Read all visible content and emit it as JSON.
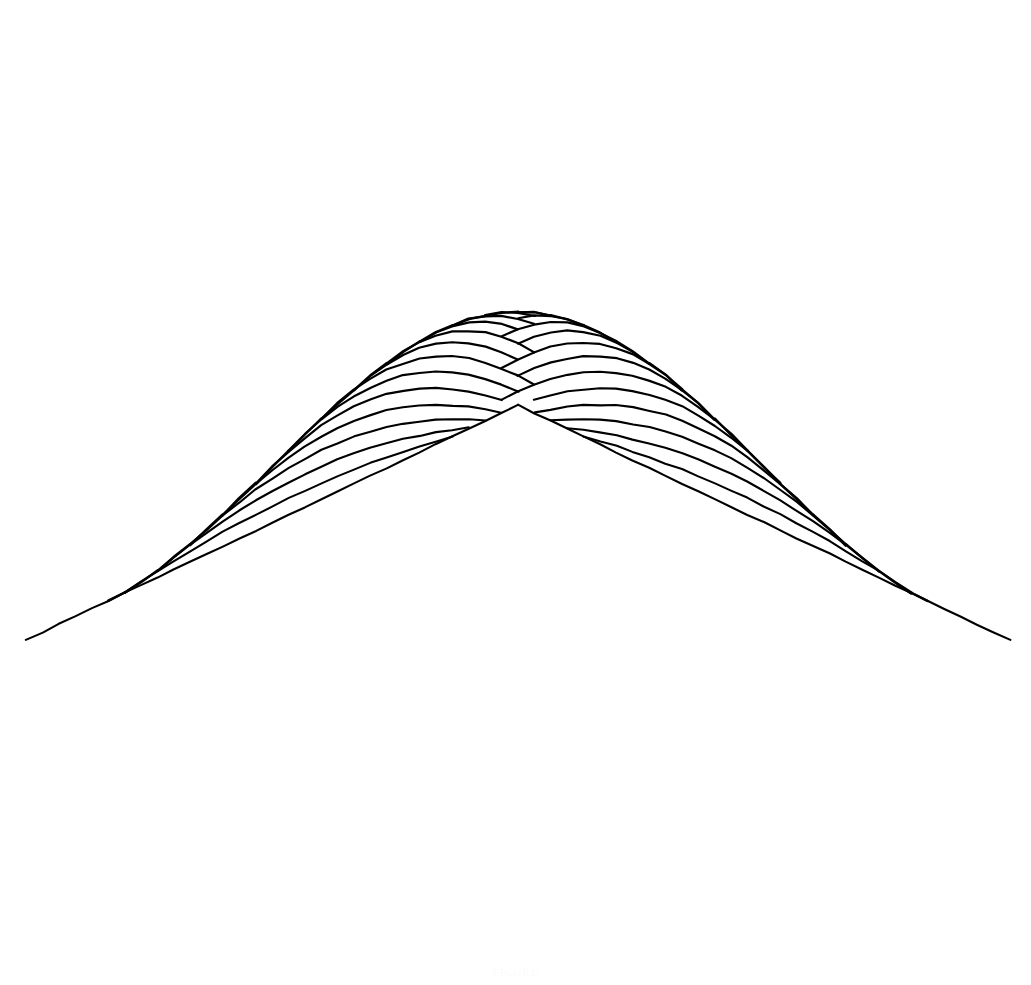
{
  "figure": {
    "title": "",
    "caption": "FIGURE",
    "background_color": "#ffffff",
    "line_color": "#000000"
  },
  "chart_data": {
    "type": "line",
    "plot_kind": "3d-wireframe-surface",
    "title": "",
    "subtitle": "",
    "xlabel": "",
    "ylabel": "",
    "zlabel": "",
    "grid": false,
    "legend": "none",
    "axes_visible": false,
    "tick_labels": [],
    "annotations": [],
    "surface_function": "z = cos(pi*u/2) * cos(pi*v/2)",
    "domain": {
      "u": [
        -1,
        1
      ],
      "v": [
        -1,
        1
      ]
    },
    "zlim": [
      0,
      1
    ],
    "grid_divisions": {
      "u": 30,
      "v": 30
    },
    "projection": {
      "type": "oblique-parallel",
      "azimuth_deg": 45,
      "elevation_deg": 28,
      "scale_x": 470,
      "scale_y": 470,
      "scale_z": 470,
      "origin_x": 518,
      "origin_y": 640
    },
    "silhouette_points": {
      "apex": [
        490,
        32
      ],
      "left_corner": [
        36,
        792
      ],
      "right_corner": [
        1002,
        636
      ],
      "front_corner": [
        646,
        950
      ],
      "back_corner": [
        490,
        34
      ]
    },
    "style": {
      "stroke_width_near": 2.6,
      "stroke_width_far": 1.9,
      "stroke_linecap": "round",
      "hand_drawn_jitter": 1.15
    },
    "x": [
      -1,
      -0.9333,
      -0.8667,
      -0.8,
      -0.7333,
      -0.6667,
      -0.6,
      -0.5333,
      -0.4667,
      -0.4,
      -0.3333,
      -0.2667,
      -0.2,
      -0.1333,
      -0.0667,
      0,
      0.0667,
      0.1333,
      0.2,
      0.2667,
      0.3333,
      0.4,
      0.4667,
      0.5333,
      0.6,
      0.6667,
      0.7333,
      0.8,
      0.8667,
      0.9333,
      1
    ],
    "values": [
      0,
      0.1045,
      0.2079,
      0.309,
      0.4067,
      0.5,
      0.5878,
      0.6691,
      0.7431,
      0.809,
      0.866,
      0.9135,
      0.9511,
      0.9781,
      0.9945,
      1,
      0.9945,
      0.9781,
      0.9511,
      0.9135,
      0.866,
      0.809,
      0.7431,
      0.6691,
      0.5878,
      0.5,
      0.4067,
      0.309,
      0.2079,
      0.1045,
      0
    ]
  }
}
